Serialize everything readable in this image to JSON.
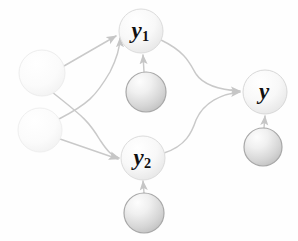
{
  "diagram": {
    "kind": "path-diagram",
    "background_color": "#fefefe",
    "edge_color": "#c9c9c9",
    "label_color": "#111111",
    "nodes": [
      {
        "id": "x1",
        "name": "exogenous-node-1",
        "label": "",
        "cx": 42,
        "cy": 73,
        "r": 23,
        "style": "faint",
        "fill_light": "#ffffff",
        "fill_dark": "#f4f4f4",
        "stroke": "#ededed"
      },
      {
        "id": "x2",
        "name": "exogenous-node-2",
        "label": "",
        "cx": 40,
        "cy": 130,
        "r": 22,
        "style": "faint",
        "fill_light": "#ffffff",
        "fill_dark": "#f5f5f5",
        "stroke": "#efefef"
      },
      {
        "id": "y1",
        "name": "mediator-node-y1",
        "label": "y1",
        "label_base": "y",
        "label_sub": "1",
        "cx": 141,
        "cy": 31,
        "r": 22,
        "style": "light",
        "fill_light": "#ffffff",
        "fill_dark": "#ebebeb",
        "stroke": "#dcdcdc"
      },
      {
        "id": "y2",
        "name": "mediator-node-y2",
        "label": "y2",
        "label_base": "y",
        "label_sub": "2",
        "cx": 143,
        "cy": 158,
        "r": 22,
        "style": "light",
        "fill_light": "#ffffff",
        "fill_dark": "#ebebeb",
        "stroke": "#dcdcdc"
      },
      {
        "id": "y",
        "name": "outcome-node-y",
        "label": "y",
        "label_base": "y",
        "label_sub": "",
        "cx": 265,
        "cy": 92,
        "r": 22,
        "style": "light",
        "fill_light": "#ffffff",
        "fill_dark": "#eaeaea",
        "stroke": "#d8d8d8"
      },
      {
        "id": "e1",
        "name": "disturbance-node-e1",
        "label": "",
        "cx": 146,
        "cy": 92,
        "r": 20,
        "style": "shaded",
        "fill_light": "#fbfbfb",
        "fill_dark": "#c4c4c4",
        "stroke": "#a8a8a8"
      },
      {
        "id": "e2",
        "name": "disturbance-node-e2",
        "label": "",
        "cx": 144,
        "cy": 213,
        "r": 20,
        "style": "shaded",
        "fill_light": "#fbfbfb",
        "fill_dark": "#c4c4c4",
        "stroke": "#a8a8a8"
      },
      {
        "id": "e3",
        "name": "disturbance-node-e3",
        "label": "",
        "cx": 263,
        "cy": 147,
        "r": 19,
        "style": "shaded",
        "fill_light": "#fbfbfb",
        "fill_dark": "#c4c4c4",
        "stroke": "#a8a8a8"
      }
    ],
    "edges": [
      {
        "name": "edge-x1-to-y1",
        "from": "x1",
        "to": "y1",
        "shape": "straight",
        "path": "M 64 66 L 116 36",
        "arrow": true
      },
      {
        "name": "edge-x1-to-y2",
        "from": "x1",
        "to": "y2",
        "shape": "curve",
        "path": "M 52 92 C 82 116 88 120 100 140 C 108 152 112 156 119 158",
        "arrow": true
      },
      {
        "name": "edge-x2-to-y1",
        "from": "x2",
        "to": "y1",
        "shape": "curve",
        "path": "M 59 119 C 88 104 96 96 110 72 C 118 56 120 46 120 38",
        "arrow": true
      },
      {
        "name": "edge-x2-to-y2",
        "from": "x2",
        "to": "y2",
        "shape": "straight",
        "path": "M 60 139 L 118 159",
        "arrow": true
      },
      {
        "name": "edge-y1-to-y",
        "from": "y1",
        "to": "y",
        "shape": "curve",
        "path": "M 161 40 C 186 52 190 64 196 74 C 204 86 222 90 240 91",
        "arrow": true
      },
      {
        "name": "edge-y2-to-y",
        "from": "y2",
        "to": "y",
        "shape": "curve",
        "path": "M 164 153 C 186 146 192 132 196 120 C 204 102 222 94 240 92",
        "arrow": true
      },
      {
        "name": "edge-e1-to-y1",
        "from": "e1",
        "to": "y1",
        "shape": "straight-vertical",
        "path": "M 144 72 L 143 55",
        "arrow": true
      },
      {
        "name": "edge-e2-to-y2",
        "from": "e2",
        "to": "y2",
        "shape": "straight-vertical",
        "path": "M 144 193 L 143 181",
        "arrow": true
      },
      {
        "name": "edge-e3-to-y",
        "from": "e3",
        "to": "y",
        "shape": "straight-vertical",
        "path": "M 264 128 L 265 116",
        "arrow": true
      }
    ]
  }
}
